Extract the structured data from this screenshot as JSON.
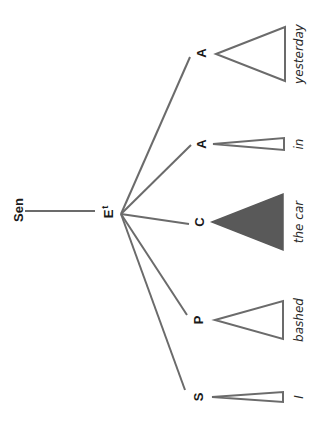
{
  "diagram": {
    "type": "syntax-tree",
    "orientation": "rotated-90-ccw",
    "colors": {
      "line": "#6b6b6b",
      "text": "#1a1a1a",
      "filled_triangle": "#595959"
    },
    "root": {
      "label": "Sen"
    },
    "clause": {
      "label": "E",
      "superscript": "t"
    },
    "constituents": [
      {
        "label": "S",
        "word": "I",
        "triangle": "narrow-outline"
      },
      {
        "label": "P",
        "word": "bashed",
        "triangle": "outline"
      },
      {
        "label": "C",
        "word": "the car",
        "triangle": "filled"
      },
      {
        "label": "A",
        "word": "in",
        "triangle": "narrow-outline"
      },
      {
        "label": "A",
        "word": "yesterday",
        "triangle": "outline"
      }
    ]
  }
}
